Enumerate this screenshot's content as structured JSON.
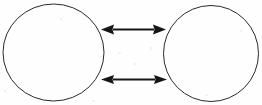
{
  "canvas": {
    "width": 262,
    "height": 105,
    "background_color": "#fefefe",
    "stroke_color": "#1a1a1a",
    "title": "Two circles connected by two bidirectional arrows"
  },
  "shapes": {
    "left_circle": {
      "label": "",
      "center_x": 53.5,
      "center_y": 52.5,
      "radius_x": 50.5,
      "radius_y": 48.5,
      "stroke_color": "#2a2a2a",
      "stroke_width": 1,
      "fill": "none"
    },
    "right_circle": {
      "label": "",
      "center_x": 211,
      "center_y": 53.5,
      "radius_x": 47.5,
      "radius_y": 48,
      "stroke_color": "#2a2a2a",
      "stroke_width": 1,
      "fill": "none"
    }
  },
  "arrows": {
    "upper": {
      "label": "",
      "x1": 101,
      "x2": 166,
      "y": 29.5,
      "shaft_width": 2,
      "head_length": 13,
      "head_width": 10,
      "color": "#161616",
      "direction": "bidirectional"
    },
    "lower": {
      "label": "",
      "x1": 101,
      "x2": 167,
      "y": 79.5,
      "shaft_width": 2,
      "head_length": 13,
      "head_width": 9,
      "color": "#161616",
      "direction": "bidirectional"
    }
  },
  "artifacts": {
    "description": "faint scanner speckle",
    "specks": [
      {
        "x": 4,
        "y": 90,
        "w": 2,
        "h": 2
      },
      {
        "x": 118,
        "y": 52,
        "w": 3,
        "h": 2
      },
      {
        "x": 150,
        "y": 47,
        "w": 2,
        "h": 3
      },
      {
        "x": 134,
        "y": 63,
        "w": 2,
        "h": 2
      },
      {
        "x": 205,
        "y": 94,
        "w": 3,
        "h": 2
      },
      {
        "x": 60,
        "y": 18,
        "w": 2,
        "h": 2
      },
      {
        "x": 240,
        "y": 30,
        "w": 2,
        "h": 2
      },
      {
        "x": 92,
        "y": 100,
        "w": 3,
        "h": 2
      }
    ]
  }
}
